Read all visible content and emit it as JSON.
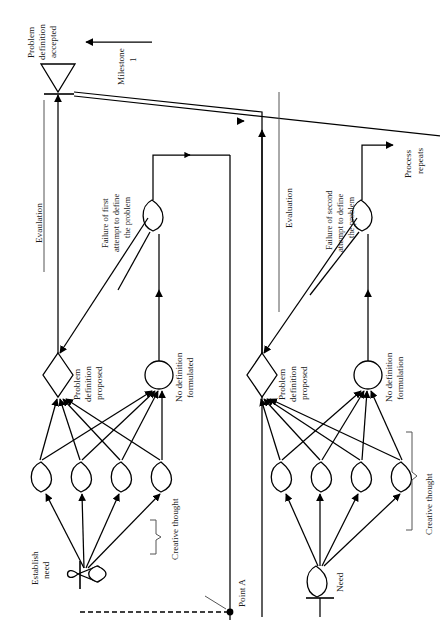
{
  "figure": {
    "orientation": "rotated-90",
    "background_color": "#ffffff",
    "line_color": "#000000",
    "text_color": "#1a1a1a"
  },
  "labels": {
    "problem_definition_accepted": "Problem\ndefinition\naccepted",
    "problem_definition_accepted_l1": "Problem",
    "problem_definition_accepted_l2": "definition",
    "problem_definition_accepted_l3": "accepted",
    "milestone": "Milestone",
    "milestone_number": "1",
    "evaluation_left": "Evaulation",
    "evaluation_right": "Evaluation",
    "failure_first_l1": "Failure of first",
    "failure_first_l2": "attempt to define",
    "failure_first_l3": "the problem",
    "failure_second_l1": "Failure of second",
    "failure_second_l2": "attempt to define",
    "failure_second_l3": "the problem",
    "process_repeats_l1": "Process",
    "process_repeats_l2": "repeats",
    "problem_definition_proposed_l1": "Problem",
    "problem_definition_proposed_l2": "definition",
    "problem_definition_proposed_l3": "proposed",
    "no_definition_formulated_l1": "No definition",
    "no_definition_formulated_l2": "formulated",
    "no_definition_formulation_l1": "No definition",
    "no_definition_formulation_l2": "formulation",
    "establish_need_l1": "Establish",
    "establish_need_l2": "need",
    "need": "Need",
    "creative_thought_left": "Creative thought",
    "creative_thought_right": "Creative thought",
    "point_a": "Point A"
  },
  "nodes": {
    "left_cluster": {
      "start_label": "Establish need",
      "decision_label": "Problem definition proposed",
      "circle_label": "No definition formulated",
      "idea_count": 4,
      "terminator_label": "Problem definition accepted"
    },
    "right_cluster": {
      "start_label": "Need",
      "decision_label": "Problem definition proposed",
      "circle_label": "No definition formulation",
      "idea_count": 4,
      "exit_label": "Process repeats"
    }
  }
}
